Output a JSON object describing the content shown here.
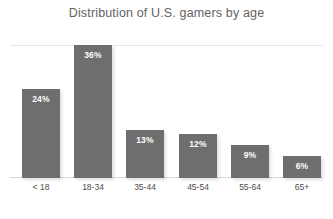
{
  "chart_data": {
    "type": "bar",
    "title": "Distribution of U.S. gamers by age",
    "xlabel": "",
    "ylabel": "",
    "ylim": [
      0,
      40
    ],
    "grid": true,
    "legend": false,
    "categories": [
      "< 18",
      "18-34",
      "35-44",
      "45-54",
      "55-64",
      "65+"
    ],
    "values": [
      24,
      36,
      13,
      12,
      9,
      6
    ],
    "value_labels": [
      "24%",
      "36%",
      "13%",
      "12%",
      "9%",
      "6%"
    ],
    "series": [
      {
        "name": "Share of U.S. gamers",
        "values": [
          24,
          36,
          13,
          12,
          9,
          6
        ]
      }
    ]
  },
  "colors": {
    "bar": "#6e6e6e",
    "title": "#636363",
    "axis_label": "#4d4d4d",
    "gridline": "#e6e6e6",
    "baseline": "#d9d9d9",
    "value_label": "#ffffff",
    "background": "#ffffff"
  }
}
